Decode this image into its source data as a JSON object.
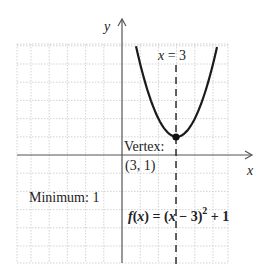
{
  "graph": {
    "axes": {
      "x_label": "x",
      "y_label": "y",
      "origin_px": [
        122,
        155
      ],
      "unit_px": 18.2,
      "x_range": [
        -6,
        6
      ],
      "y_range": [
        -6,
        6
      ]
    },
    "function": {
      "expression_prefix": "f(x) = (x − 3)",
      "exponent": "2",
      "expression_suffix": " + 1",
      "a": 1,
      "h": 3,
      "k": 1
    },
    "axis_of_symmetry_label": "x = 3",
    "vertex_label": "Vertex:",
    "vertex_coords": "(3, 1)",
    "minimum_label": "Minimum: 1",
    "colors": {
      "curve": "#1a1a1a",
      "axes": "#555555",
      "grid": "#c8c8c8",
      "text": "#222222"
    }
  }
}
